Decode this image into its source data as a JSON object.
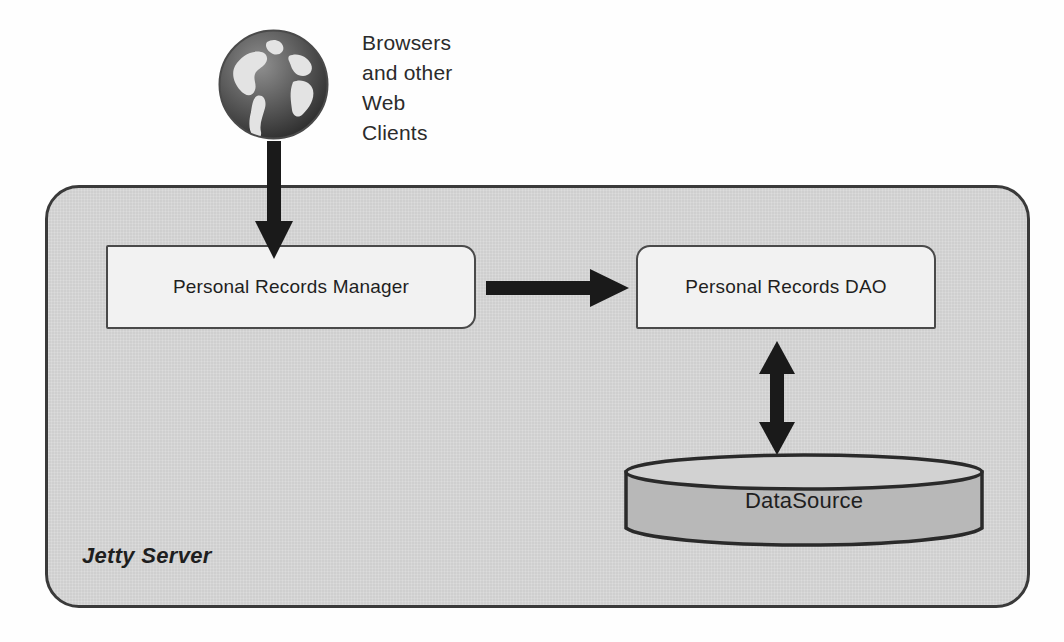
{
  "diagram": {
    "server": {
      "label": "Jetty Server",
      "fill": "#d6d6d6",
      "border": "#3a3a3a"
    },
    "client": {
      "icon": "globe-icon",
      "label_lines": [
        "Browsers",
        "and other",
        "Web",
        "Clients"
      ]
    },
    "components": [
      {
        "id": "personal-records-manager",
        "label": "Personal Records Manager",
        "fill": "#f2f2f2",
        "border": "#4a4a4a"
      },
      {
        "id": "personal-records-dao",
        "label": "Personal Records DAO",
        "fill": "#f2f2f2",
        "border": "#4a4a4a"
      }
    ],
    "datastore": {
      "id": "datasource",
      "label": "DataSource",
      "shape": "cylinder",
      "body_fill": "#b8b8b8",
      "top_fill": "#d0d0d0",
      "border": "#2a2a2a"
    },
    "connections": [
      {
        "id": "client-to-manager",
        "from": "Browsers and other Web Clients",
        "to": "Personal Records Manager",
        "direction": "down",
        "heads": 1,
        "color": "#1a1a1a"
      },
      {
        "id": "manager-to-dao",
        "from": "Personal Records Manager",
        "to": "Personal Records DAO",
        "direction": "right",
        "heads": 1,
        "color": "#1a1a1a"
      },
      {
        "id": "dao-to-datasource",
        "from": "Personal Records DAO",
        "to": "DataSource",
        "direction": "bidirectional",
        "heads": 2,
        "color": "#1a1a1a"
      }
    ]
  }
}
